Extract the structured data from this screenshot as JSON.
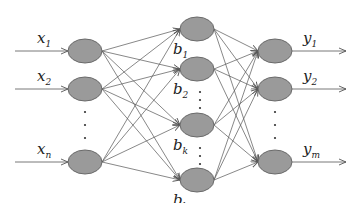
{
  "diagram": {
    "type": "neural-network",
    "colors": {
      "node_fill": "#9a9a9a",
      "node_stroke": "#6a6a6a",
      "edge": "#555555",
      "text": "#222222"
    },
    "input_layer": {
      "x": 85,
      "nodes": [
        {
          "y": 51,
          "label": "x",
          "sub": "1"
        },
        {
          "y": 89,
          "label": "x",
          "sub": "2"
        },
        {
          "y": 162,
          "label": "x",
          "sub": "n"
        }
      ],
      "ellipsis_ys": [
        112,
        125,
        138
      ]
    },
    "hidden_layer": {
      "x": 197,
      "nodes": [
        {
          "y": 29,
          "label": "b",
          "sub": "1"
        },
        {
          "y": 69,
          "label": "b",
          "sub": "2"
        },
        {
          "y": 125,
          "label": "b",
          "sub": "k"
        },
        {
          "y": 180,
          "label": "b",
          "sub": "l"
        }
      ],
      "ellipsis_ys": [
        [
          92,
          100,
          108
        ],
        [
          148,
          156,
          164
        ]
      ]
    },
    "output_layer": {
      "x": 275,
      "nodes": [
        {
          "y": 51,
          "label": "y",
          "sub": "1"
        },
        {
          "y": 89,
          "label": "y",
          "sub": "2"
        },
        {
          "y": 162,
          "label": "y",
          "sub": "m"
        }
      ],
      "ellipsis_ys": [
        112,
        125,
        138
      ]
    }
  }
}
